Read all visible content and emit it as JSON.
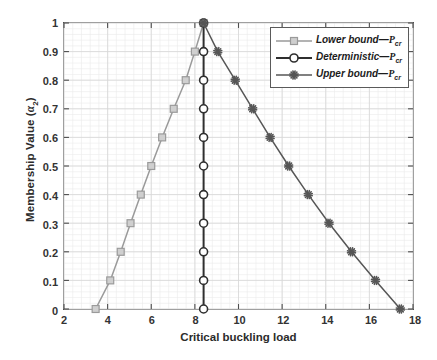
{
  "chart_data": {
    "type": "line",
    "title": "",
    "xlabel": "Critical buckling load",
    "ylabel_text": "Membership Value (",
    "ylabel_symbol": "α",
    "ylabel_subscript": "2",
    "ylabel_close": ")",
    "xlim": [
      2,
      18
    ],
    "ylim": [
      0,
      1
    ],
    "xticks": [
      2,
      4,
      6,
      8,
      10,
      12,
      14,
      16,
      18
    ],
    "yticks": [
      0,
      0.1,
      0.2,
      0.3,
      0.4,
      0.5,
      0.6,
      0.7,
      0.8,
      0.9,
      1
    ],
    "ytick_labels": [
      "0",
      "0.1",
      "0.2",
      "0.3",
      "0.4",
      "0.5",
      "0.6",
      "0.7",
      "0.8",
      "0.9",
      "1"
    ],
    "xtick_labels": [
      "2",
      "4",
      "6",
      "8",
      "10",
      "12",
      "14",
      "16",
      "18"
    ],
    "grid": true,
    "minor_grid": true,
    "legend_position": "upper right",
    "series": [
      {
        "name": "Lower bound",
        "symbol": "P",
        "subscript": "cr",
        "marker": "square",
        "color": "#9a9a9a",
        "points": [
          [
            3.45,
            0.0
          ],
          [
            4.12,
            0.1
          ],
          [
            4.6,
            0.2
          ],
          [
            5.05,
            0.3
          ],
          [
            5.52,
            0.4
          ],
          [
            6.0,
            0.5
          ],
          [
            6.5,
            0.6
          ],
          [
            7.03,
            0.7
          ],
          [
            7.58,
            0.8
          ],
          [
            8.0,
            0.9
          ],
          [
            8.4,
            1.0
          ]
        ]
      },
      {
        "name": "Deterministic",
        "symbol": "P",
        "subscript": "cr",
        "marker": "circle",
        "color": "#2f2f2f",
        "points": [
          [
            8.4,
            0.0
          ],
          [
            8.4,
            0.1
          ],
          [
            8.4,
            0.2
          ],
          [
            8.4,
            0.3
          ],
          [
            8.4,
            0.4
          ],
          [
            8.4,
            0.5
          ],
          [
            8.4,
            0.6
          ],
          [
            8.4,
            0.7
          ],
          [
            8.4,
            0.8
          ],
          [
            8.4,
            0.9
          ],
          [
            8.4,
            1.0
          ]
        ]
      },
      {
        "name": "Upper bound",
        "symbol": "P",
        "subscript": "cr",
        "marker": "star",
        "color": "#565656",
        "points": [
          [
            8.4,
            1.0
          ],
          [
            9.05,
            0.9
          ],
          [
            9.85,
            0.8
          ],
          [
            10.65,
            0.7
          ],
          [
            11.45,
            0.6
          ],
          [
            12.3,
            0.5
          ],
          [
            13.2,
            0.4
          ],
          [
            14.15,
            0.3
          ],
          [
            15.18,
            0.2
          ],
          [
            16.28,
            0.1
          ],
          [
            17.42,
            0.0
          ]
        ]
      }
    ]
  }
}
